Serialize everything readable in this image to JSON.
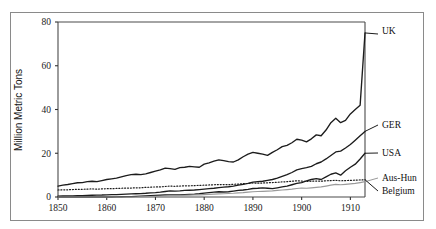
{
  "chart_data": {
    "type": "line",
    "title": "",
    "xlabel": "",
    "ylabel": "Million Metric Tons",
    "xlim": [
      1850,
      1913
    ],
    "ylim": [
      0,
      80
    ],
    "grid": false,
    "legend_position": "right-inline-labels",
    "xticks": [
      "1850",
      "1860",
      "1870",
      "1880",
      "1890",
      "1900",
      "1910"
    ],
    "xtick_values": [
      1850,
      1860,
      1870,
      1880,
      1890,
      1900,
      1910
    ],
    "yticks": [
      "0",
      "20",
      "40",
      "60",
      "80"
    ],
    "ytick_values": [
      0,
      20,
      40,
      60,
      80
    ],
    "x": [
      1850,
      1851,
      1852,
      1853,
      1854,
      1855,
      1856,
      1857,
      1858,
      1859,
      1860,
      1861,
      1862,
      1863,
      1864,
      1865,
      1866,
      1867,
      1868,
      1869,
      1870,
      1871,
      1872,
      1873,
      1874,
      1875,
      1876,
      1877,
      1878,
      1879,
      1880,
      1881,
      1882,
      1883,
      1884,
      1885,
      1886,
      1887,
      1888,
      1889,
      1890,
      1891,
      1892,
      1893,
      1894,
      1895,
      1896,
      1897,
      1898,
      1899,
      1900,
      1901,
      1902,
      1903,
      1904,
      1905,
      1906,
      1907,
      1908,
      1909,
      1910,
      1911,
      1912,
      1913
    ],
    "series": [
      {
        "name": "UK",
        "label": "UK",
        "color": "#1c1c1c",
        "style": "solid",
        "values": [
          5.0,
          5.4,
          5.7,
          6.1,
          6.5,
          6.6,
          7.0,
          7.2,
          7.0,
          7.5,
          8.0,
          8.3,
          8.6,
          9.2,
          9.8,
          10.2,
          10.4,
          10.2,
          10.6,
          11.2,
          11.8,
          12.4,
          13.2,
          13.0,
          12.6,
          13.4,
          13.6,
          14.0,
          13.8,
          13.6,
          15.0,
          15.6,
          16.4,
          17.0,
          16.6,
          16.2,
          16.0,
          17.0,
          18.4,
          19.6,
          20.4,
          20.0,
          19.6,
          19.0,
          20.4,
          21.6,
          23.0,
          23.6,
          24.8,
          26.4,
          26.0,
          25.2,
          26.6,
          28.4,
          28.0,
          30.6,
          34.0,
          36.0,
          34.0,
          35.0,
          38.0,
          40.0,
          42.0,
          75.0
        ]
      },
      {
        "name": "GER",
        "label": "GER",
        "color": "#1c1c1c",
        "style": "solid",
        "values": [
          0.4,
          0.45,
          0.5,
          0.55,
          0.6,
          0.65,
          0.75,
          0.8,
          0.85,
          0.9,
          1.0,
          1.05,
          1.1,
          1.2,
          1.3,
          1.4,
          1.5,
          1.55,
          1.7,
          1.9,
          2.0,
          2.2,
          2.5,
          2.8,
          2.7,
          2.8,
          3.0,
          3.1,
          3.2,
          3.4,
          3.6,
          3.8,
          4.0,
          4.3,
          4.5,
          4.7,
          5.0,
          5.4,
          5.8,
          6.2,
          6.8,
          7.0,
          7.2,
          7.6,
          8.0,
          8.6,
          9.4,
          10.2,
          11.2,
          12.4,
          13.0,
          13.4,
          14.0,
          15.2,
          16.0,
          17.4,
          19.0,
          20.6,
          21.0,
          22.4,
          24.0,
          26.0,
          28.0,
          30.0
        ]
      },
      {
        "name": "USA",
        "label": "USA",
        "color": "#1c1c1c",
        "style": "solid",
        "values": [
          0.0,
          0.0,
          0.0,
          0.0,
          0.0,
          0.0,
          0.0,
          0.0,
          0.0,
          0.0,
          0.0,
          0.0,
          0.05,
          0.1,
          0.15,
          0.2,
          0.3,
          0.4,
          0.5,
          0.6,
          0.7,
          0.8,
          0.9,
          1.0,
          0.95,
          1.0,
          1.1,
          1.2,
          1.3,
          1.5,
          1.8,
          2.0,
          2.2,
          2.4,
          2.3,
          2.4,
          2.7,
          3.0,
          3.2,
          3.5,
          3.9,
          4.0,
          4.2,
          4.0,
          3.8,
          4.2,
          4.6,
          5.0,
          5.6,
          6.2,
          6.6,
          7.4,
          8.0,
          8.4,
          8.0,
          9.2,
          10.4,
          11.0,
          10.0,
          12.0,
          13.6,
          15.0,
          17.4,
          20.0
        ]
      },
      {
        "name": "Aus-Hun",
        "label": "Aus-Hun",
        "color": "#9a9a9a",
        "style": "solid",
        "values": [
          0.0,
          0.0,
          0.0,
          0.0,
          0.0,
          0.0,
          0.0,
          0.0,
          0.0,
          0.0,
          0.0,
          0.0,
          0.0,
          0.0,
          0.0,
          0.0,
          0.0,
          0.05,
          0.1,
          0.2,
          0.3,
          0.4,
          0.5,
          0.6,
          0.6,
          0.7,
          0.8,
          0.85,
          0.9,
          1.0,
          1.1,
          1.2,
          1.3,
          1.4,
          1.5,
          1.6,
          1.7,
          1.9,
          2.0,
          2.2,
          2.4,
          2.5,
          2.6,
          2.7,
          2.8,
          3.0,
          3.2,
          3.4,
          3.6,
          3.9,
          4.1,
          4.0,
          4.2,
          4.4,
          4.6,
          5.0,
          5.4,
          5.8,
          5.6,
          5.8,
          6.0,
          6.2,
          6.6,
          7.0
        ]
      },
      {
        "name": "Belgium",
        "label": "Belgium",
        "color": "#1c1c1c",
        "style": "dotted",
        "values": [
          3.2,
          3.3,
          3.3,
          3.4,
          3.5,
          3.5,
          3.6,
          3.7,
          3.6,
          3.7,
          3.8,
          3.8,
          3.9,
          4.0,
          4.1,
          4.1,
          4.2,
          4.2,
          4.4,
          4.5,
          4.6,
          4.6,
          4.8,
          5.0,
          4.9,
          5.0,
          5.1,
          5.1,
          5.2,
          5.3,
          5.4,
          5.5,
          5.6,
          5.7,
          5.7,
          5.6,
          5.8,
          5.9,
          6.1,
          6.2,
          6.4,
          6.3,
          6.4,
          6.5,
          6.6,
          6.7,
          6.9,
          7.0,
          7.2,
          7.4,
          7.3,
          7.1,
          7.2,
          7.3,
          7.2,
          7.4,
          7.5,
          7.6,
          7.4,
          7.5,
          7.6,
          7.7,
          7.8,
          7.9
        ]
      }
    ]
  },
  "labels": {
    "uk": "UK",
    "ger": "GER",
    "usa": "USA",
    "aushun": "Aus-Hun",
    "belgium": "Belgium"
  },
  "axis": {
    "ylabel": "Million Metric Tons"
  },
  "colors": {
    "dark": "#1c1c1c",
    "gray": "#9a9a9a",
    "frame": "#8a8a8a"
  }
}
